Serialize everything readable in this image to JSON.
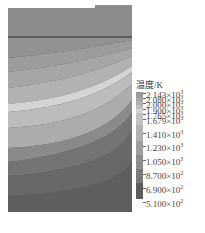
{
  "chart_data": {
    "type": "heatmap",
    "title": "",
    "legend": {
      "title": "温度/K",
      "unit": "K",
      "levels": [
        {
          "label": "2.143×10^3",
          "mantissa": "2.143",
          "exp": "3",
          "value": 2143,
          "color": "#9a9a9a"
        },
        {
          "label": "2.080×10^3",
          "mantissa": "2.080",
          "exp": "3",
          "value": 2080,
          "color": "#a4a4a4"
        },
        {
          "label": "2.000×10^3",
          "mantissa": "2.000",
          "exp": "3",
          "value": 2000,
          "color": "#b0b0b0"
        },
        {
          "label": "1.900×10^3",
          "mantissa": "1.900",
          "exp": "3",
          "value": 1900,
          "color": "#bdbdbd"
        },
        {
          "label": "1.765×10^3",
          "mantissa": "1.765",
          "exp": "3",
          "value": 1765,
          "color": "#d6d6d6"
        },
        {
          "label": "1.679×10^3",
          "mantissa": "1.679",
          "exp": "3",
          "value": 1679,
          "color": "#c2c2c2"
        },
        {
          "label": "1.410×10^3",
          "mantissa": "1.410",
          "exp": "3",
          "value": 1410,
          "color": "#b2b2b2"
        },
        {
          "label": "1.230×10^3",
          "mantissa": "1.230",
          "exp": "3",
          "value": 1230,
          "color": "#9e9e9e"
        },
        {
          "label": "1.050×10^3",
          "mantissa": "1.050",
          "exp": "3",
          "value": 1050,
          "color": "#8e8e8e"
        },
        {
          "label": "8.700×10^2",
          "mantissa": "8.700",
          "exp": "2",
          "value": 870,
          "color": "#7a7a7a"
        },
        {
          "label": "6.900×10^2",
          "mantissa": "6.900",
          "exp": "2",
          "value": 690,
          "color": "#6a6a6a"
        },
        {
          "label": "5.100×10^2",
          "mantissa": "5.100",
          "exp": "2",
          "value": 510,
          "color": "#5c5c5c"
        }
      ]
    },
    "domain_description": "Temperature contour field on a rectangular cross-section with curved isotherm bands; a horizontal boundary line near the top.",
    "xlabel": "",
    "ylabel": ""
  }
}
